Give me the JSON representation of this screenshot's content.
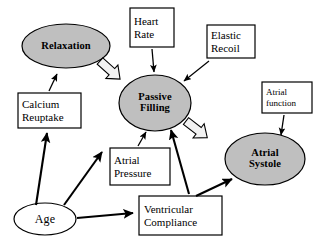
{
  "diagram": {
    "type": "flow-diagram",
    "colors": {
      "node_fill_gray": "#bfbfbf",
      "node_fill_white": "#ffffff",
      "stroke": "#000000",
      "block_arrow_fill": "#f2f2f2",
      "background": "#ffffff"
    },
    "ellipses": [
      {
        "id": "relaxation",
        "label": "Relaxation",
        "lines": [
          "Relaxation"
        ],
        "fill": "#bfbfbf",
        "bold": true,
        "cx": 66,
        "cy": 46,
        "rx": 44,
        "ry": 22
      },
      {
        "id": "passive-filling",
        "label": "Passive Filling",
        "lines": [
          "Passive",
          "Filling"
        ],
        "fill": "#bfbfbf",
        "bold": true,
        "cx": 155,
        "cy": 103,
        "rx": 36,
        "ry": 28
      },
      {
        "id": "atrial-systole",
        "label": "Atrial Systole",
        "lines": [
          "Atrial",
          "Systole"
        ],
        "fill": "#bfbfbf",
        "bold": true,
        "cx": 265,
        "cy": 159,
        "rx": 40,
        "ry": 26
      },
      {
        "id": "age",
        "label": "Age",
        "lines": [
          "Age"
        ],
        "fill": "#ffffff",
        "bold": false,
        "cx": 45,
        "cy": 219,
        "rx": 31,
        "ry": 16
      }
    ],
    "boxes": [
      {
        "id": "heart-rate",
        "label": "Heart Rate",
        "lines": [
          "Heart",
          "Rate"
        ],
        "x": 130,
        "y": 8,
        "w": 44,
        "h": 39
      },
      {
        "id": "elastic-recoil",
        "label": "Elastic Recoil",
        "lines": [
          "Elastic",
          "Recoil"
        ],
        "x": 207,
        "y": 25,
        "w": 48,
        "h": 33
      },
      {
        "id": "atrial-function",
        "label": "Atrial function",
        "lines": [
          "Atrial",
          "function"
        ],
        "small": true,
        "x": 262,
        "y": 82,
        "w": 50,
        "h": 31
      },
      {
        "id": "calcium-reuptake",
        "label": "Calcium Reuptake",
        "lines": [
          "Calcium",
          "Reuptake"
        ],
        "x": 18,
        "y": 93,
        "w": 63,
        "h": 35
      },
      {
        "id": "atrial-pressure",
        "label": "Atrial Pressure",
        "lines": [
          "Atrial",
          "Pressure"
        ],
        "x": 110,
        "y": 148,
        "w": 60,
        "h": 37
      },
      {
        "id": "ventricular-compliance",
        "label": "Ventricular Compliance",
        "lines": [
          "Ventricular",
          "Compliance"
        ],
        "x": 139,
        "y": 196,
        "w": 83,
        "h": 39
      }
    ],
    "connections": [
      {
        "id": "relaxation-to-passive-filling",
        "from": "relaxation",
        "to": "passive-filling",
        "style": "block-arrow"
      },
      {
        "id": "passive-filling-to-atrial-systole",
        "from": "passive-filling",
        "to": "atrial-systole",
        "style": "block-arrow"
      },
      {
        "id": "heart-rate-to-passive-filling",
        "from": "heart-rate",
        "to": "passive-filling",
        "style": "thin-arrow"
      },
      {
        "id": "elastic-recoil-to-passive-filling",
        "from": "elastic-recoil",
        "to": "passive-filling",
        "style": "thin-arrow"
      },
      {
        "id": "atrial-function-to-atrial-systole",
        "from": "atrial-function",
        "to": "atrial-systole",
        "style": "thin-arrow"
      },
      {
        "id": "calcium-reuptake-to-relaxation",
        "from": "calcium-reuptake",
        "to": "relaxation",
        "style": "thin-arrow"
      },
      {
        "id": "atrial-pressure-to-passive-filling",
        "from": "atrial-pressure",
        "to": "passive-filling",
        "style": "thin-arrow"
      },
      {
        "id": "ventricular-compliance-to-passive-filling",
        "from": "ventricular-compliance",
        "to": "passive-filling",
        "style": "thick-arrow"
      },
      {
        "id": "ventricular-compliance-to-atrial-systole",
        "from": "ventricular-compliance",
        "to": "atrial-systole",
        "style": "thick-arrow"
      },
      {
        "id": "age-to-calcium-reuptake",
        "from": "age",
        "to": "calcium-reuptake",
        "style": "thick-arrow"
      },
      {
        "id": "age-to-atrial-pressure",
        "from": "age",
        "to": "atrial-pressure",
        "style": "thick-arrow"
      },
      {
        "id": "age-to-ventricular-compliance",
        "from": "age",
        "to": "ventricular-compliance",
        "style": "thick-arrow"
      }
    ]
  }
}
